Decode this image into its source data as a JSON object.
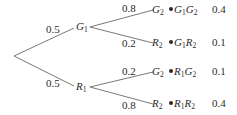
{
  "diagram": {
    "type": "probability-tree",
    "root": {
      "branches": [
        {
          "prob": "0.5",
          "node": {
            "letter": "G",
            "sub": "1"
          },
          "branches": [
            {
              "prob": "0.8",
              "node": {
                "letter": "G",
                "sub": "2"
              },
              "outcome": {
                "a": "G",
                "as": "1",
                "b": "G",
                "bs": "2"
              },
              "joint": "0.4"
            },
            {
              "prob": "0.2",
              "node": {
                "letter": "R",
                "sub": "2"
              },
              "outcome": {
                "a": "G",
                "as": "1",
                "b": "R",
                "bs": "2"
              },
              "joint": "0.1"
            }
          ]
        },
        {
          "prob": "0.5",
          "node": {
            "letter": "R",
            "sub": "1"
          },
          "branches": [
            {
              "prob": "0.2",
              "node": {
                "letter": "G",
                "sub": "2"
              },
              "outcome": {
                "a": "R",
                "as": "1",
                "b": "G",
                "bs": "2"
              },
              "joint": "0.1"
            },
            {
              "prob": "0.8",
              "node": {
                "letter": "R",
                "sub": "2"
              },
              "outcome": {
                "a": "R",
                "as": "1",
                "b": "R",
                "bs": "2"
              },
              "joint": "0.4"
            }
          ]
        }
      ]
    },
    "colors": {
      "line": "#6a6a6a",
      "text": "#2a2a2a"
    }
  }
}
